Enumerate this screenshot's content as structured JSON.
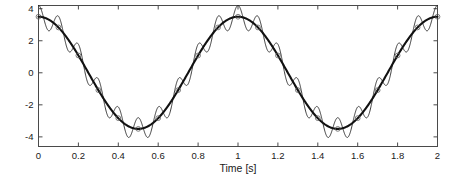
{
  "figure": {
    "background_color": "#ffffff",
    "width": 461,
    "height": 180
  },
  "axes": {
    "box_color": "#4a4a4a",
    "x_label": "Time [s]",
    "y_label": "",
    "x_ticks": [
      "0",
      "0.2",
      "0.4",
      "0.6",
      "0.8",
      "1",
      "1.2",
      "1.4",
      "1.6",
      "1.8",
      "2"
    ],
    "y_ticks": [
      "4",
      "2",
      "0",
      "-2",
      "-4"
    ]
  },
  "chart_data": {
    "type": "line",
    "title": "",
    "xlabel": "Time [s]",
    "ylabel": "",
    "xlim": [
      0,
      2
    ],
    "ylim": [
      -4.6,
      4.2
    ],
    "grid": false,
    "legend": "none",
    "x_tick_values": [
      0,
      0.2,
      0.4,
      0.6,
      0.8,
      1,
      1.2,
      1.4,
      1.6,
      1.8,
      2
    ],
    "x_tick_labels": [
      "0",
      "0.2",
      "0.4",
      "0.6",
      "0.8",
      "1",
      "1.2",
      "1.4",
      "1.6",
      "1.8",
      "2"
    ],
    "y_tick_values": [
      4,
      2,
      0,
      -2,
      -4
    ],
    "y_tick_labels": [
      "4",
      "2",
      "0",
      "-2",
      "-4"
    ],
    "series": [
      {
        "name": "carrier",
        "style": "thick-solid-with-markers",
        "color": "#111111",
        "line_width": 2.1,
        "description": "Slow 1 Hz cosine, amplitude 3.5",
        "formula": "y = 3.5 * cos(2*pi*1*t)",
        "amplitude": 3.5,
        "frequency_hz": 1,
        "phase_deg": 0,
        "offset": 0,
        "marker": "circle",
        "marker_count": 21,
        "marker_spacing_s": 0.1
      },
      {
        "name": "ripple",
        "style": "thin-solid",
        "color": "#1c1c1c",
        "line_width": 0.85,
        "description": "Carrier plus fast 10 Hz ripple, ripple amplitude 0.7",
        "formula": "y = 3.5 * cos(2*pi*1*t) + 0.7 * cos(2*pi*10*t)",
        "carrier_amplitude": 3.5,
        "carrier_frequency_hz": 1,
        "ripple_amplitude": 0.7,
        "ripple_frequency_hz": 10,
        "phase_deg": 0
      }
    ]
  }
}
